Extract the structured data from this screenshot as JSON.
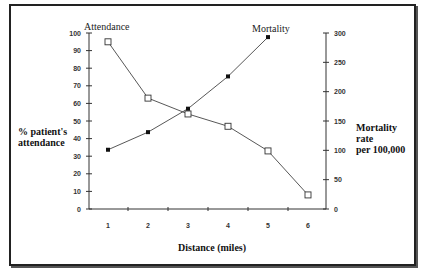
{
  "chart_data": {
    "type": "line",
    "title": "",
    "xlabel": "Distance (miles)",
    "ylabel": "% patient's attendance",
    "ylabel_right": "Mortality rate per 100,000",
    "x": [
      1,
      2,
      3,
      4,
      5,
      6
    ],
    "x_ticks": [
      "1",
      "2",
      "3",
      "4",
      "5",
      "6"
    ],
    "y_ticks_left": [
      "0",
      "10",
      "20",
      "30",
      "40",
      "50",
      "60",
      "70",
      "80",
      "90",
      "100"
    ],
    "y_ticks_right": [
      "0",
      "50",
      "100",
      "150",
      "200",
      "250",
      "300"
    ],
    "ylim_left": [
      0,
      100
    ],
    "ylim_right": [
      0,
      300
    ],
    "grid": false,
    "series": [
      {
        "name": "Attendance",
        "axis": "left",
        "marker": "open-square",
        "x": [
          1,
          2,
          3,
          4,
          5,
          6
        ],
        "values": [
          95,
          63,
          54,
          47,
          33,
          8
        ]
      },
      {
        "name": "Mortality",
        "axis": "right",
        "marker": "filled-square",
        "x": [
          1,
          2,
          3,
          4,
          5
        ],
        "values": [
          101,
          131,
          171,
          226,
          293
        ]
      }
    ],
    "annotations": [
      "Attendance",
      "Mortality"
    ]
  },
  "labels": {
    "attendance": "Attendance",
    "mortality": "Mortality",
    "ylabel_left_line1": "% patient's",
    "ylabel_left_line2": "attendance",
    "ylabel_right_line1": "Mortality",
    "ylabel_right_line2": "rate",
    "ylabel_right_line3": "per 100,000",
    "xlabel": "Distance (miles)"
  }
}
